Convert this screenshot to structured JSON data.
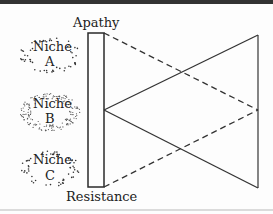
{
  "diagram": {
    "top_label": "Apathy",
    "bottom_label": "Resistance",
    "niches": [
      {
        "line1": "Niche",
        "line2": "A",
        "style": "sparse-dots"
      },
      {
        "line1": "Niche",
        "line2": "B",
        "style": "dense-dots"
      },
      {
        "line1": "Niche",
        "line2": "C",
        "style": "sparse-dots"
      }
    ],
    "colors": {
      "ink": "#2a2a2a",
      "border": "#333333",
      "rule": "#cfcfcf"
    }
  }
}
